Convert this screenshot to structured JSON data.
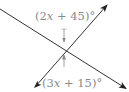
{
  "diagram": {
    "type": "intersecting-lines-vertical-angles",
    "colors": {
      "line": "#333333",
      "label": "#8a8a8a",
      "marker": "#8a8a8a",
      "background": "#ffffff"
    },
    "angles": {
      "top": {
        "label": "(2x + 45)°",
        "open": "(",
        "coef": "2",
        "var": "x",
        "rest": " + 45)°"
      },
      "bottom": {
        "label": "(3x + 15)°",
        "open": "(",
        "coef": "3",
        "var": "x",
        "rest": " + 15)°"
      }
    },
    "lines": [
      {
        "name": "line-descending",
        "from": [
          0,
          9
        ],
        "to": [
          127,
          89
        ],
        "arrow_end": true
      },
      {
        "name": "line-ascending",
        "from": [
          34,
          88
        ],
        "to": [
          108,
          4
        ],
        "arrow_both": true
      }
    ],
    "intersection": [
      64,
      49
    ]
  }
}
